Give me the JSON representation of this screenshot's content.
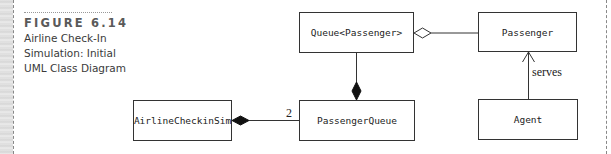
{
  "figure": {
    "label": "FIGURE 6.14",
    "caption_lines": [
      "Airline Check-In",
      "Simulation: Initial",
      "UML Class Diagram"
    ]
  },
  "diagram": {
    "classes": [
      {
        "id": "queue",
        "name": "Queue<Passenger>"
      },
      {
        "id": "passenger",
        "name": "Passenger"
      },
      {
        "id": "airline_checkin_sim",
        "name": "AirlineCheckinSim"
      },
      {
        "id": "passenger_queue",
        "name": "PassengerQueue"
      },
      {
        "id": "agent",
        "name": "Agent"
      }
    ],
    "relationships": [
      {
        "from": "queue",
        "to": "passenger",
        "type": "aggregation",
        "label": ""
      },
      {
        "from": "passenger_queue",
        "to": "queue",
        "type": "composition",
        "label": ""
      },
      {
        "from": "airline_checkin_sim",
        "to": "passenger_queue",
        "type": "composition",
        "multiplicity": "2"
      },
      {
        "from": "agent",
        "to": "passenger",
        "type": "association",
        "label": "serves"
      }
    ]
  },
  "colors": {
    "line": "#333333",
    "figure_label": "#5a5a5a",
    "caption_text": "#3a3a3a"
  }
}
